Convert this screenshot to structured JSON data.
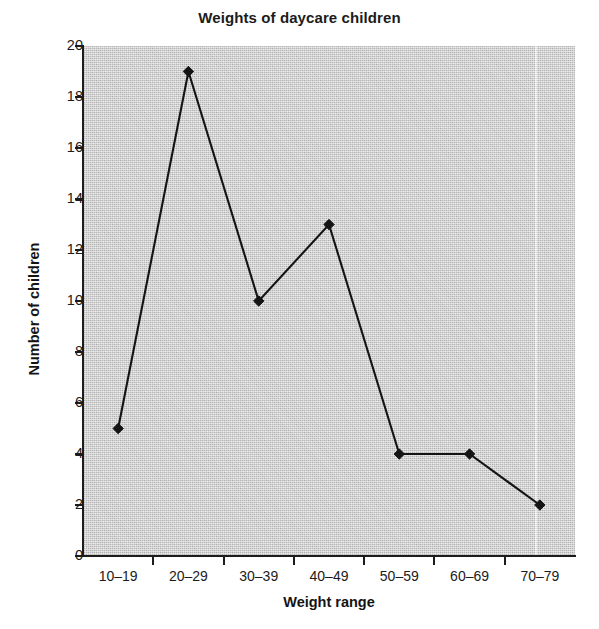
{
  "chart_data": {
    "type": "line",
    "title": "Weights of daycare children",
    "xlabel": "Weight range",
    "ylabel": "Number of children",
    "categories": [
      "10–19",
      "20–29",
      "30–39",
      "40–49",
      "50–59",
      "60–69",
      "70–79"
    ],
    "values": [
      5,
      19,
      10,
      13,
      4,
      4,
      2
    ],
    "series": [
      {
        "name": "Number of children",
        "values": [
          5,
          19,
          10,
          13,
          4,
          4,
          2
        ]
      }
    ],
    "ylim": [
      0,
      20
    ],
    "ytick_labels": [
      "0",
      "2",
      "4",
      "6",
      "8",
      "10",
      "12",
      "14",
      "16",
      "18",
      "20"
    ],
    "ytick_values": [
      0,
      2,
      4,
      6,
      8,
      10,
      12,
      14,
      16,
      18,
      20
    ],
    "ytick_step": 2,
    "grid": false,
    "legend": "none",
    "marker": "diamond",
    "line_color": "#141414",
    "marker_color": "#141414",
    "plot_background_color": "#b9b9b9",
    "figure_background_color": "#ffffff"
  }
}
